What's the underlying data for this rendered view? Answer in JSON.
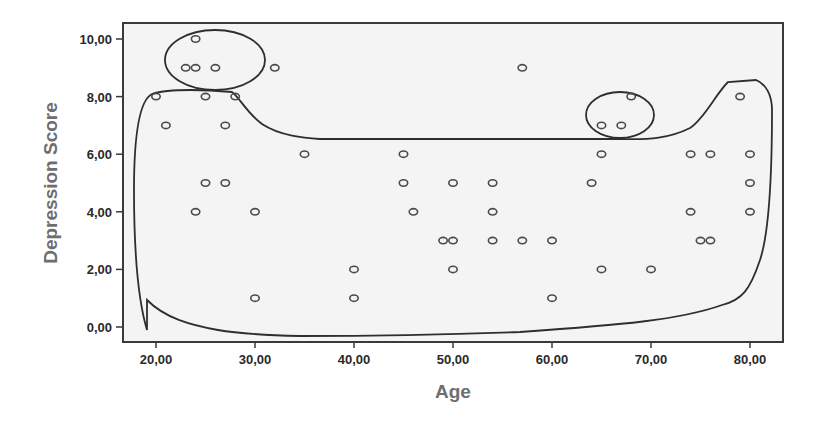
{
  "chart_data": {
    "type": "scatter",
    "title": "",
    "xlabel": "Age",
    "ylabel": "Depression Score",
    "xlim": [
      17,
      83
    ],
    "ylim": [
      -0.5,
      10.5
    ],
    "xticks": [
      20,
      30,
      40,
      50,
      60,
      70,
      80
    ],
    "xtick_labels": [
      "20,00",
      "30,00",
      "40,00",
      "50,00",
      "60,00",
      "70,00",
      "80,00"
    ],
    "yticks": [
      0,
      2,
      4,
      6,
      8,
      10
    ],
    "ytick_labels": [
      "0,00",
      "2,00",
      "4,00",
      "6,00",
      "8,00",
      "10,00"
    ],
    "grid": false,
    "legend": null,
    "marker": "open-circle",
    "points": [
      {
        "x": 24,
        "y": 10
      },
      {
        "x": 23,
        "y": 9
      },
      {
        "x": 24,
        "y": 9
      },
      {
        "x": 26,
        "y": 9
      },
      {
        "x": 32,
        "y": 9
      },
      {
        "x": 57,
        "y": 9
      },
      {
        "x": 20,
        "y": 8
      },
      {
        "x": 25,
        "y": 8
      },
      {
        "x": 28,
        "y": 8
      },
      {
        "x": 68,
        "y": 8
      },
      {
        "x": 79,
        "y": 8
      },
      {
        "x": 21,
        "y": 7
      },
      {
        "x": 27,
        "y": 7
      },
      {
        "x": 65,
        "y": 7
      },
      {
        "x": 67,
        "y": 7
      },
      {
        "x": 35,
        "y": 6
      },
      {
        "x": 45,
        "y": 6
      },
      {
        "x": 65,
        "y": 6
      },
      {
        "x": 74,
        "y": 6
      },
      {
        "x": 76,
        "y": 6
      },
      {
        "x": 80,
        "y": 6
      },
      {
        "x": 25,
        "y": 5
      },
      {
        "x": 27,
        "y": 5
      },
      {
        "x": 45,
        "y": 5
      },
      {
        "x": 50,
        "y": 5
      },
      {
        "x": 54,
        "y": 5
      },
      {
        "x": 64,
        "y": 5
      },
      {
        "x": 80,
        "y": 5
      },
      {
        "x": 24,
        "y": 4
      },
      {
        "x": 30,
        "y": 4
      },
      {
        "x": 46,
        "y": 4
      },
      {
        "x": 54,
        "y": 4
      },
      {
        "x": 74,
        "y": 4
      },
      {
        "x": 80,
        "y": 4
      },
      {
        "x": 49,
        "y": 3
      },
      {
        "x": 50,
        "y": 3
      },
      {
        "x": 54,
        "y": 3
      },
      {
        "x": 57,
        "y": 3
      },
      {
        "x": 60,
        "y": 3
      },
      {
        "x": 75,
        "y": 3
      },
      {
        "x": 76,
        "y": 3
      },
      {
        "x": 40,
        "y": 2
      },
      {
        "x": 50,
        "y": 2
      },
      {
        "x": 65,
        "y": 2
      },
      {
        "x": 70,
        "y": 2
      },
      {
        "x": 30,
        "y": 1
      },
      {
        "x": 40,
        "y": 1
      },
      {
        "x": 60,
        "y": 1
      }
    ],
    "annotations": [
      {
        "type": "ellipse",
        "label": "outlier-group-young-high",
        "center": [
          28,
          9.2
        ],
        "rx_age": 5,
        "ry_score": 1.0
      },
      {
        "type": "ellipse",
        "label": "outlier-group-older-high",
        "center": [
          67.5,
          7.3
        ],
        "rx_age": 3.5,
        "ry_score": 0.8
      },
      {
        "type": "freeform-outline",
        "label": "main-cluster-boundary"
      }
    ]
  }
}
